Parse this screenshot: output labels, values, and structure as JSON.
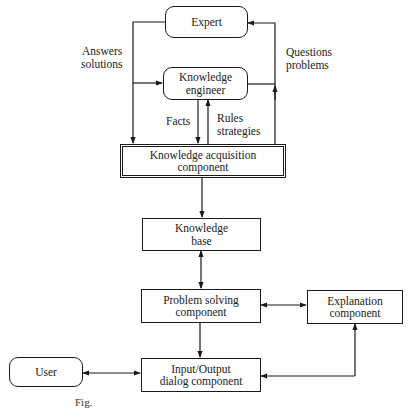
{
  "diagram": {
    "nodes": {
      "expert": {
        "line1": "Expert",
        "line2": ""
      },
      "knowledge_engineer": {
        "line1": "Knowledge",
        "line2": "engineer"
      },
      "knowledge_acquisition": {
        "line1": "Knowledge acquisition",
        "line2": "component"
      },
      "knowledge_base": {
        "line1": "Knowledge",
        "line2": "base"
      },
      "problem_solving": {
        "line1": "Problem solving",
        "line2": "component"
      },
      "explanation": {
        "line1": "Explanation",
        "line2": "component"
      },
      "io_dialog": {
        "line1": "Input/Output",
        "line2": "dialog component"
      },
      "user": {
        "line1": "User",
        "line2": ""
      }
    },
    "edge_labels": {
      "answers": {
        "line1": "Answers",
        "line2": "solutions"
      },
      "questions": {
        "line1": "Questions",
        "line2": "problems"
      },
      "facts": {
        "line1": "Facts"
      },
      "rules": {
        "line1": "Rules",
        "line2": "strategies"
      }
    },
    "edges": [
      {
        "from": "expert",
        "to": "knowledge_acquisition",
        "label": "answers"
      },
      {
        "from": "expert",
        "to": "knowledge_engineer",
        "label": "answers"
      },
      {
        "from": "knowledge_acquisition",
        "to": "expert",
        "label": "questions"
      },
      {
        "from": "knowledge_engineer",
        "to": "expert",
        "label": "questions"
      },
      {
        "from": "knowledge_engineer",
        "to": "knowledge_acquisition",
        "label": "facts"
      },
      {
        "from": "knowledge_acquisition",
        "to": "knowledge_engineer",
        "label": "rules"
      },
      {
        "from": "knowledge_acquisition",
        "to": "knowledge_base"
      },
      {
        "from": "knowledge_base",
        "to": "problem_solving",
        "bidirectional": true
      },
      {
        "from": "problem_solving",
        "to": "explanation",
        "bidirectional": true
      },
      {
        "from": "problem_solving",
        "to": "io_dialog"
      },
      {
        "from": "io_dialog",
        "to": "explanation"
      },
      {
        "from": "explanation",
        "to": "io_dialog"
      },
      {
        "from": "user",
        "to": "io_dialog",
        "bidirectional": true
      }
    ],
    "caption": "Fig."
  }
}
